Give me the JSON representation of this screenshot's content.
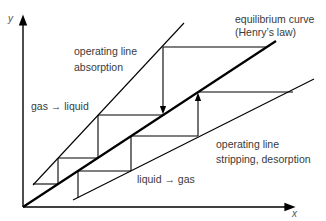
{
  "axes": {
    "x_label": "x",
    "y_label": "y"
  },
  "labels": {
    "equilibrium_line1": "equilibrium curve",
    "equilibrium_line2": "(Henry’s law)",
    "absorption_line1": "operating line",
    "absorption_line2": "absorption",
    "gas_to_liquid": "gas → liquid",
    "stripping_line1": "operating line",
    "stripping_line2": "stripping, desorption",
    "liquid_to_gas": "liquid → gas"
  },
  "colors": {
    "line": "#000000",
    "text": "#3a3a3a",
    "background": "#ffffff"
  }
}
